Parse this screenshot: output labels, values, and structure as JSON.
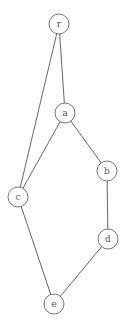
{
  "graph": {
    "node_radius": 10,
    "colors": {
      "background": "#ffffff",
      "edge": "#555555",
      "node_stroke": "#666666",
      "label": "#555555"
    },
    "nodes": [
      {
        "id": "r",
        "label": "r",
        "x": 59,
        "y": 24
      },
      {
        "id": "a",
        "label": "a",
        "x": 65,
        "y": 113
      },
      {
        "id": "b",
        "label": "b",
        "x": 107,
        "y": 171
      },
      {
        "id": "c",
        "label": "c",
        "x": 18,
        "y": 197
      },
      {
        "id": "d",
        "label": "d",
        "x": 108,
        "y": 239
      },
      {
        "id": "e",
        "label": "e",
        "x": 54,
        "y": 304
      }
    ],
    "edges": [
      {
        "from": "r",
        "to": "a"
      },
      {
        "from": "r",
        "to": "c"
      },
      {
        "from": "a",
        "to": "c"
      },
      {
        "from": "a",
        "to": "b"
      },
      {
        "from": "b",
        "to": "d"
      },
      {
        "from": "c",
        "to": "e"
      },
      {
        "from": "d",
        "to": "e"
      }
    ]
  }
}
